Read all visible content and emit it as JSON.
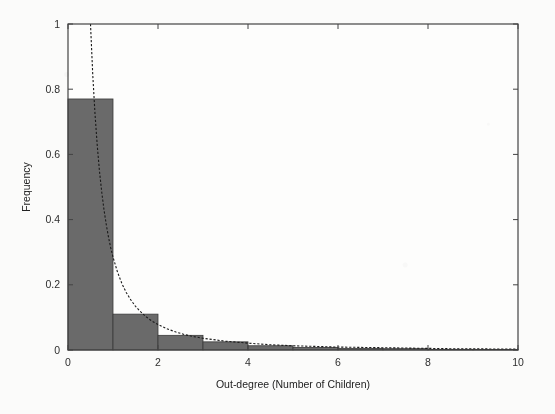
{
  "chart_data": {
    "type": "bar",
    "title": "",
    "subtitle": "",
    "xlabel": "Out-degree (Number of Children)",
    "ylabel": "Frequency",
    "xlim": [
      0,
      10
    ],
    "ylim": [
      0,
      1
    ],
    "grid": false,
    "legend": null,
    "bin_width": 1,
    "bar_color": "#6a6a6a",
    "bar_edge_color": "#3a3a3a",
    "x_ticks": [
      0,
      2,
      4,
      6,
      8,
      10
    ],
    "x_tick_labels": [
      "0",
      "2",
      "4",
      "6",
      "8",
      "10"
    ],
    "y_ticks": [
      0,
      0.2,
      0.4,
      0.6,
      0.8,
      1
    ],
    "y_tick_labels": [
      "0",
      "0.2",
      "0.4",
      "0.6",
      "0.8",
      "1"
    ],
    "categories": [
      "0-1",
      "1-2",
      "2-3",
      "3-4",
      "4-5",
      "5-6",
      "6-7",
      "7-8",
      "8-9",
      "9-10"
    ],
    "bin_left_edges": [
      0,
      1,
      2,
      3,
      4,
      5,
      6,
      7,
      8,
      9
    ],
    "values": [
      0.77,
      0.11,
      0.045,
      0.025,
      0.013,
      0.008,
      0.005,
      0.004,
      0.002,
      0.001
    ],
    "series": [
      {
        "name": "Observed out-degree histogram",
        "type": "bar",
        "values": [
          0.77,
          0.11,
          0.045,
          0.025,
          0.013,
          0.008,
          0.005,
          0.004,
          0.002,
          0.001
        ]
      },
      {
        "name": "Fitted power-law curve",
        "type": "line",
        "style": "dashed",
        "color": "#1a1a1a",
        "x": [
          0.5,
          0.55,
          0.6,
          0.65,
          0.7,
          0.75,
          0.8,
          0.85,
          0.9,
          0.95,
          1.0,
          1.1,
          1.2,
          1.3,
          1.4,
          1.5,
          1.6,
          1.7,
          1.8,
          1.9,
          2.0,
          2.2,
          2.4,
          2.6,
          2.8,
          3.0,
          3.5,
          4.0,
          4.5,
          5.0,
          5.5,
          6.0,
          6.5,
          7.0,
          7.5,
          8.0,
          8.5,
          9.0,
          9.5,
          10.0
        ],
        "y": [
          1.0,
          0.845,
          0.724,
          0.627,
          0.548,
          0.484,
          0.43,
          0.385,
          0.346,
          0.313,
          0.285,
          0.239,
          0.203,
          0.175,
          0.153,
          0.134,
          0.119,
          0.106,
          0.095,
          0.086,
          0.078,
          0.065,
          0.055,
          0.047,
          0.041,
          0.036,
          0.027,
          0.021,
          0.016,
          0.013,
          0.011,
          0.009,
          0.008,
          0.007,
          0.006,
          0.005,
          0.004,
          0.004,
          0.003,
          0.003
        ]
      }
    ],
    "annotations": []
  }
}
